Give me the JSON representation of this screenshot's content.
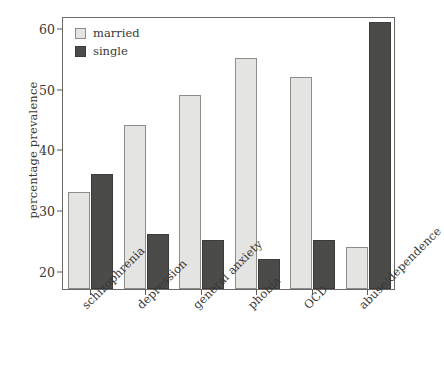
{
  "chart_data": {
    "type": "bar",
    "title": "",
    "xlabel": "",
    "ylabel": "percentage prevalence",
    "categories": [
      "schizophrenia",
      "depression",
      "general anxiety",
      "phobia",
      "OCD",
      "abuse/dependence"
    ],
    "series": [
      {
        "name": "married",
        "color": "#e4e4e2",
        "values": [
          33,
          44,
          49,
          55,
          52,
          24
        ]
      },
      {
        "name": "single",
        "color": "#4b4b4a",
        "values": [
          36,
          26,
          25,
          22,
          25,
          61
        ]
      }
    ],
    "ylim": [
      17,
      62
    ],
    "yticks": [
      20,
      30,
      40,
      50,
      60
    ],
    "ytick_labels": [
      "20",
      "30",
      "40",
      "50",
      "60"
    ],
    "grid": false,
    "legend_position": "top-left-inside",
    "frame": true,
    "xtick_label_rotation": -45
  },
  "legend": {
    "items": [
      {
        "label": "married",
        "swatch": "married-swatch"
      },
      {
        "label": "single",
        "swatch": "single-swatch"
      }
    ]
  }
}
